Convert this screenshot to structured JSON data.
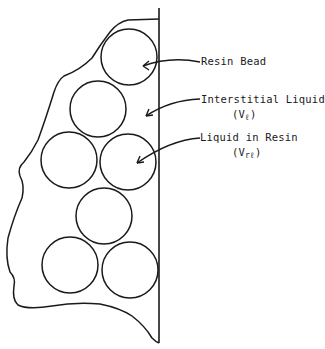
{
  "diagram": {
    "labels": {
      "resin_bead": "Resin Bead",
      "interstitial_liquid": "Interstitial Liquid",
      "interstitial_symbol_open": "(V",
      "interstitial_symbol_sub": "ℓ",
      "interstitial_symbol_close": ")",
      "liquid_in_resin": "Liquid in Resin",
      "resin_symbol_open": "(V",
      "resin_symbol_sub": "rℓ",
      "resin_symbol_close": ")"
    },
    "beads": [
      {
        "cx": 129,
        "cy": 57,
        "r": 28
      },
      {
        "cx": 98,
        "cy": 109,
        "r": 28
      },
      {
        "cx": 69,
        "cy": 160,
        "r": 28
      },
      {
        "cx": 128,
        "cy": 162,
        "r": 28
      },
      {
        "cx": 104,
        "cy": 216,
        "r": 28
      },
      {
        "cx": 70,
        "cy": 265,
        "r": 28
      },
      {
        "cx": 130,
        "cy": 270,
        "r": 28
      }
    ],
    "stroke_color": "#1a1a1a"
  }
}
